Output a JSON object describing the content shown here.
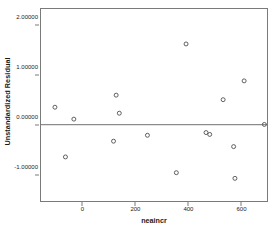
{
  "chart_data": {
    "type": "scatter",
    "title": "",
    "xlabel": "neaincr",
    "ylabel": "Unstandardized Residual",
    "xlim": [
      -160,
      700
    ],
    "ylim": [
      -1.55,
      2.35
    ],
    "grid": false,
    "legend": null,
    "reference_line": {
      "orientation": "horizontal",
      "value": 0.0
    },
    "x_ticks": [
      {
        "value": 0,
        "label": "0"
      },
      {
        "value": 200,
        "label": "200"
      },
      {
        "value": 400,
        "label": "400"
      },
      {
        "value": 600,
        "label": "600"
      }
    ],
    "y_ticks": [
      {
        "value": 2.0,
        "label": "2.00000"
      },
      {
        "value": 1.0,
        "label": "1.00000"
      },
      {
        "value": 0.0,
        "label": "0.00000"
      },
      {
        "value": -1.0,
        "label": "-1.00000"
      }
    ],
    "marker": {
      "shape": "open-circle",
      "color": "#4d4d4d",
      "size": 4
    },
    "points": [
      {
        "x": -107,
        "y": 0.355
      },
      {
        "x": -67,
        "y": -0.655
      },
      {
        "x": -35,
        "y": 0.113
      },
      {
        "x": 116,
        "y": -0.335
      },
      {
        "x": 126,
        "y": 0.6
      },
      {
        "x": 138,
        "y": 0.233
      },
      {
        "x": 245,
        "y": -0.215
      },
      {
        "x": 355,
        "y": -0.975
      },
      {
        "x": 392,
        "y": 1.64
      },
      {
        "x": 468,
        "y": -0.16
      },
      {
        "x": 482,
        "y": -0.198
      },
      {
        "x": 533,
        "y": 0.508
      },
      {
        "x": 573,
        "y": -0.445
      },
      {
        "x": 578,
        "y": -1.09
      },
      {
        "x": 613,
        "y": 0.89
      },
      {
        "x": 690,
        "y": 0.005
      }
    ]
  }
}
